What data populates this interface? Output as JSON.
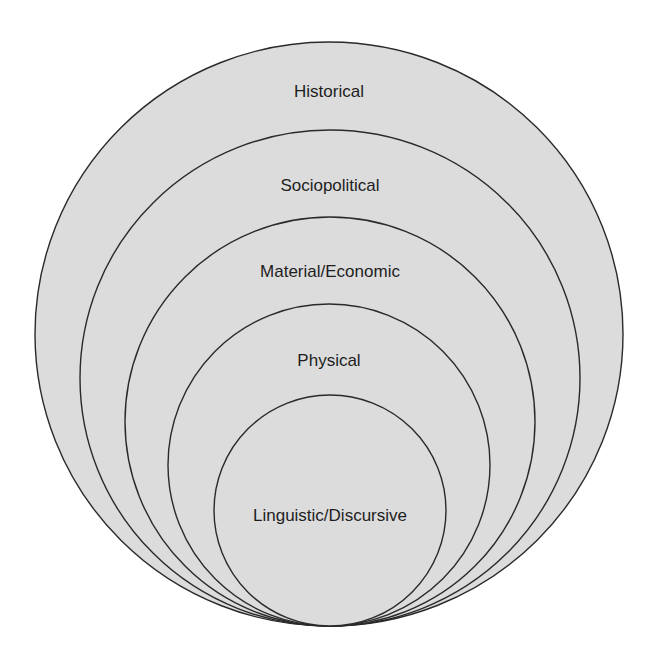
{
  "diagram": {
    "type": "nested-ellipses",
    "fill_color": "#dcdcdc",
    "stroke_color": "#2a2a2a",
    "layers": [
      {
        "label": "Historical",
        "cx": 329,
        "top": 42,
        "bottom": 626,
        "rx": 294,
        "label_y": 97
      },
      {
        "label": "Sociopolitical",
        "cx": 330,
        "top": 130,
        "bottom": 626,
        "rx": 250,
        "label_y": 191
      },
      {
        "label": "Material/Economic",
        "cx": 330,
        "top": 217,
        "bottom": 626,
        "rx": 205,
        "label_y": 277
      },
      {
        "label": "Physical",
        "cx": 329,
        "top": 304,
        "bottom": 626,
        "rx": 161,
        "label_y": 366
      },
      {
        "label": "Linguistic/Discursive",
        "cx": 330,
        "top": 395,
        "bottom": 626,
        "rx": 116,
        "label_y": 521
      }
    ]
  }
}
